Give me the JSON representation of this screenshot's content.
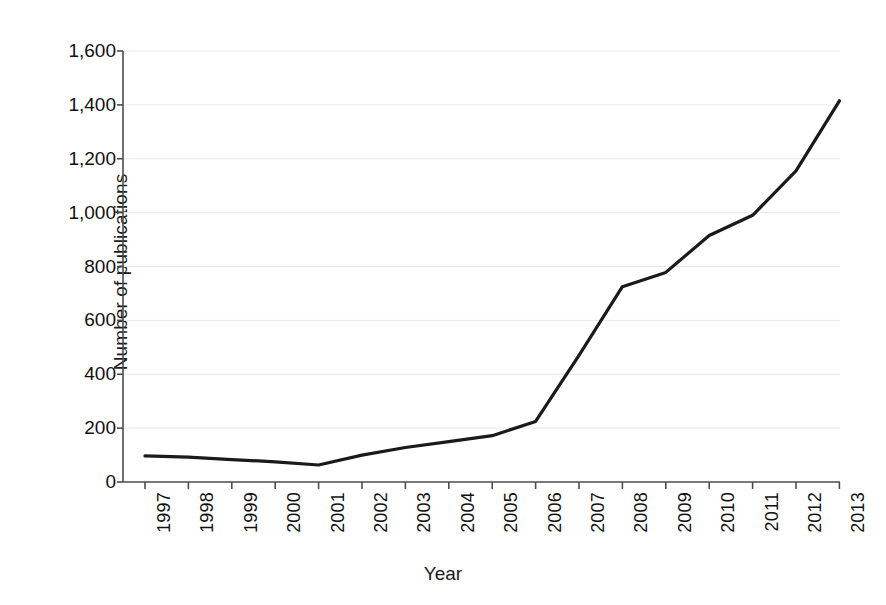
{
  "chart_data": {
    "type": "line",
    "title": "",
    "xlabel": "Year",
    "ylabel": "Number of publications",
    "categories": [
      "1997",
      "1998",
      "1999",
      "2000",
      "2001",
      "2002",
      "2003",
      "2004",
      "2005",
      "2006",
      "2007",
      "2008",
      "2009",
      "2010",
      "2011",
      "2012",
      "2013"
    ],
    "values": [
      97,
      92,
      83,
      75,
      63,
      100,
      128,
      150,
      172,
      225,
      470,
      725,
      778,
      915,
      990,
      1155,
      1415
    ],
    "series": [
      {
        "name": "Number of publications",
        "values": [
          97,
          92,
          83,
          75,
          63,
          100,
          128,
          150,
          172,
          225,
          470,
          725,
          778,
          915,
          990,
          1155,
          1415
        ]
      }
    ],
    "ylim": [
      0,
      1600
    ],
    "ytick_labels": [
      "0",
      "200",
      "400",
      "600",
      "800",
      "1,000",
      "1,200",
      "1,400",
      "1,600"
    ],
    "ytick_values": [
      0,
      200,
      400,
      600,
      800,
      1000,
      1200,
      1400,
      1600
    ],
    "xtick_labels": [
      "1997",
      "1998",
      "1999",
      "2000",
      "2001",
      "2002",
      "2003",
      "2004",
      "2005",
      "2006",
      "2007",
      "2008",
      "2009",
      "2010",
      "2011",
      "2012",
      "2013"
    ],
    "grid": true,
    "grid_axis": "y",
    "legend": false,
    "legend_position": "none",
    "line_color": "#1a1a1a",
    "grid_color": "#e8e8e8",
    "axis_color": "#4d4d4d",
    "background_color": "#ffffff",
    "xtick_rotation": -90
  }
}
